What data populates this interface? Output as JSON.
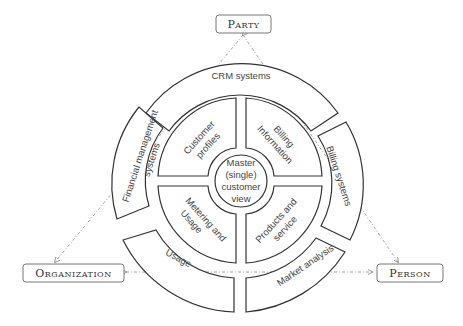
{
  "nodes": {
    "party": "Party",
    "organization": "Organization",
    "person": "Person"
  },
  "center": {
    "lines": [
      "Master",
      "(single)",
      "customer",
      "view"
    ]
  },
  "inner_ring": {
    "customer_profiles": [
      "Customer",
      "profiles"
    ],
    "billing_information": [
      "Billing",
      "Information"
    ],
    "metering_usage": [
      "Metering and",
      "Usage"
    ],
    "products_service": [
      "Products and",
      "service"
    ]
  },
  "outer_ring": {
    "crm": "CRM systems",
    "billing_systems": "Billing systems",
    "market_analysis": "Market analysis",
    "usage": "Usage",
    "financial": [
      "Financial management",
      "systems"
    ]
  },
  "colors": {
    "stroke": "#333333",
    "text": "#444444",
    "connector": "#999999"
  }
}
